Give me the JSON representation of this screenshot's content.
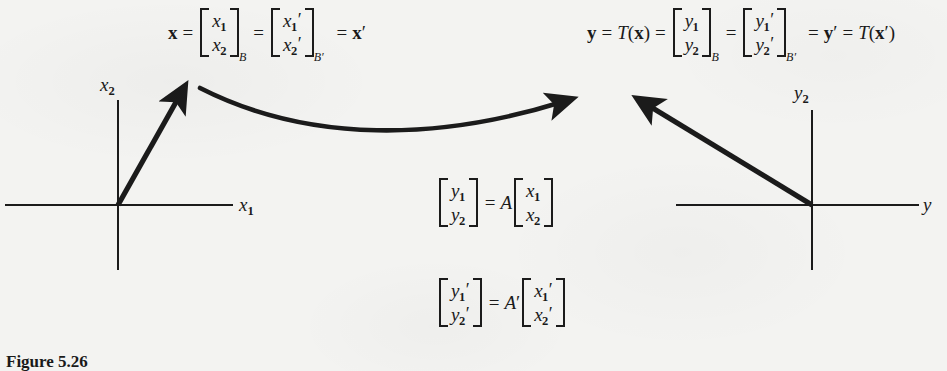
{
  "figure": {
    "caption": "Figure 5.26",
    "background_color": "#f3f3f1",
    "ink_color": "#1b1b1b"
  },
  "equations": {
    "top_left": {
      "id": "x-vector-equation",
      "lhs": "x",
      "eq1": "=",
      "vector_B": {
        "row1": "x",
        "row1_sub": "1",
        "row2": "x",
        "row2_sub": "2",
        "basis": "B"
      },
      "eq2": "=",
      "vector_Bprime": {
        "row1": "x",
        "row1_sub": "1",
        "row1_prime": "′",
        "row2": "x",
        "row2_sub": "2",
        "row2_prime": "′",
        "basis": "B′"
      },
      "eq3": "=",
      "rhs": "x",
      "rhs_prime": "′"
    },
    "top_right": {
      "id": "y-vector-equation",
      "lhs": "y",
      "eq1": "=",
      "transform": "T",
      "transform_arg": "x",
      "eq2": "=",
      "vector_B": {
        "row1": "y",
        "row1_sub": "1",
        "row2": "y",
        "row2_sub": "2",
        "basis": "B"
      },
      "eq3": "=",
      "vector_Bprime": {
        "row1": "y",
        "row1_sub": "1",
        "row1_prime": "′",
        "row2": "y",
        "row2_sub": "2",
        "row2_prime": "′",
        "basis": "B′"
      },
      "eq4": "=",
      "rhs": "y",
      "rhs_prime": "′",
      "eq5": "=",
      "transform2": "T",
      "transform2_arg": "x",
      "transform2_arg_prime": "′"
    },
    "center_upper": {
      "id": "matrix-equation-A",
      "lhs": {
        "row1": "y",
        "row1_sub": "1",
        "row2": "y",
        "row2_sub": "2"
      },
      "eq": "=",
      "matrix": "A",
      "rhs": {
        "row1": "x",
        "row1_sub": "1",
        "row2": "x",
        "row2_sub": "2"
      }
    },
    "center_lower": {
      "id": "matrix-equation-A-prime",
      "lhs": {
        "row1": "y",
        "row1_sub": "1",
        "row1_prime": "′",
        "row2": "y",
        "row2_sub": "2",
        "row2_prime": "′"
      },
      "eq": "=",
      "matrix": "A",
      "matrix_prime": "′",
      "rhs": {
        "row1": "x",
        "row1_sub": "1",
        "row1_prime": "′",
        "row2": "x",
        "row2_sub": "2",
        "row2_prime": "′"
      }
    }
  },
  "left_plot": {
    "id": "domain-plot",
    "vertical_axis_label": "x",
    "vertical_axis_sub": "2",
    "horizontal_axis_label": "x",
    "horizontal_axis_sub": "1",
    "vector_description": "bold arrow from origin pointing up and to the right"
  },
  "right_plot": {
    "id": "codomain-plot",
    "vertical_axis_label": "y",
    "vertical_axis_sub": "2",
    "horizontal_axis_label": "y",
    "vector_description": "bold arrow from origin pointing up and to the left"
  },
  "mapping_arrow": {
    "id": "transformation-arrow",
    "description": "curved arrow from left plot vector tip to right plot region"
  }
}
